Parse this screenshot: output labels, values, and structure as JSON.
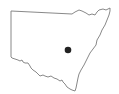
{
  "map": {
    "region": "New South Wales",
    "outline_color": "#777777",
    "marker_color": "#222222",
    "marker": {
      "x": 68,
      "y": 50,
      "r": 3.3
    }
  }
}
